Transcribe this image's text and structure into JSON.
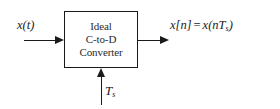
{
  "diagram": {
    "block": {
      "lines": [
        "Ideal",
        "C-to-D",
        "Converter"
      ]
    },
    "labels": {
      "input": {
        "fn": "x",
        "arg": "(t)"
      },
      "output": {
        "discrete": "x[n]",
        "equals": "=",
        "expr_open": "x(n",
        "expr_sym": "T",
        "expr_sub": "s",
        "expr_close": ")"
      },
      "clock": {
        "sym": "T",
        "sub": "s"
      }
    },
    "icons": {
      "input_arrow": "arrow-right-icon",
      "output_arrow": "arrow-right-icon",
      "clock_arrow": "arrow-up-icon"
    },
    "colors": {
      "stroke": "#1a1a1a",
      "background": "#ffffff",
      "block_text": "#2b2b2b"
    }
  }
}
